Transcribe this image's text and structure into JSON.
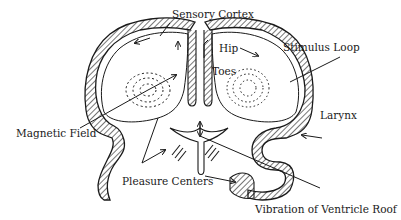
{
  "diagram": {
    "type": "anatomical sketch (brain cross-section)",
    "labels": [
      {
        "id": "sensory-cortex",
        "text": "Sensory Cortex"
      },
      {
        "id": "hip",
        "text": "Hip"
      },
      {
        "id": "toes",
        "text": "Toes"
      },
      {
        "id": "stimulus-loop",
        "text": "Stimulus Loop"
      },
      {
        "id": "magnetic-field",
        "text": "Magnetic Field"
      },
      {
        "id": "larynx",
        "text": "Larynx"
      },
      {
        "id": "pleasure-centers",
        "text": "Pleasure Centers"
      },
      {
        "id": "vibration",
        "text": "Vibration of Ventricle Roof"
      }
    ],
    "colors": {
      "ink": "#1a1a1a",
      "background": "#ffffff"
    }
  }
}
